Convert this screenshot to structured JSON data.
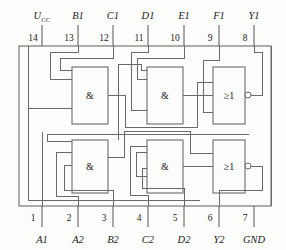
{
  "figure": {
    "kind": "ic-pinout-logic-diagram",
    "package_pins": 14,
    "ink_color": "#6b6b66",
    "text_color": "#1b1b1b",
    "background": "#fdfdfb"
  },
  "top_pins": [
    {
      "number": "14",
      "signal": "U",
      "signal_sub": "CC",
      "x": 42
    },
    {
      "number": "13",
      "signal": "B1",
      "signal_sub": "",
      "x": 78
    },
    {
      "number": "12",
      "signal": "C1",
      "signal_sub": "",
      "x": 113
    },
    {
      "number": "11",
      "signal": "D1",
      "signal_sub": "",
      "x": 148
    },
    {
      "number": "10",
      "signal": "E1",
      "signal_sub": "",
      "x": 184
    },
    {
      "number": "9",
      "signal": "F1",
      "signal_sub": "",
      "x": 219
    },
    {
      "number": "8",
      "signal": "Y1",
      "signal_sub": "",
      "x": 254
    }
  ],
  "bottom_pins": [
    {
      "number": "1",
      "signal": "A1",
      "x": 42
    },
    {
      "number": "2",
      "signal": "A2",
      "x": 78
    },
    {
      "number": "3",
      "signal": "B2",
      "x": 113
    },
    {
      "number": "4",
      "signal": "C2",
      "x": 148
    },
    {
      "number": "5",
      "signal": "D2",
      "x": 184
    },
    {
      "number": "6",
      "signal": "Y2",
      "x": 219
    },
    {
      "number": "7",
      "signal": "GND",
      "x": 254
    }
  ],
  "gates": [
    {
      "id": "and-1a",
      "symbol": "&",
      "row": "top",
      "x": 72,
      "y": 67,
      "w": 36,
      "h": 57,
      "inverting_output": false
    },
    {
      "id": "and-1b",
      "symbol": "&",
      "row": "top",
      "x": 147,
      "y": 67,
      "w": 36,
      "h": 57,
      "inverting_output": false
    },
    {
      "id": "or-1",
      "symbol": "≥1",
      "row": "top",
      "x": 213,
      "y": 67,
      "w": 32,
      "h": 57,
      "inverting_output": true
    },
    {
      "id": "and-2a",
      "symbol": "&",
      "row": "bottom",
      "x": 72,
      "y": 140,
      "w": 36,
      "h": 53,
      "inverting_output": false
    },
    {
      "id": "and-2b",
      "symbol": "&",
      "row": "bottom",
      "x": 147,
      "y": 140,
      "w": 36,
      "h": 53,
      "inverting_output": false
    },
    {
      "id": "or-2",
      "symbol": "≥1",
      "row": "bottom",
      "x": 213,
      "y": 140,
      "w": 32,
      "h": 53,
      "inverting_output": true
    }
  ],
  "package_body": {
    "x": 19,
    "y": 46,
    "w": 252,
    "h": 160
  },
  "notes": {
    "gate_and_label": "&",
    "gate_or_label": "≥1"
  }
}
